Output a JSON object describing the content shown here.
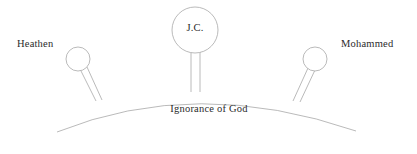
{
  "diagram": {
    "title": "Ignorance of God",
    "stroke_color": "#a8a8a8",
    "text_color": "#2b2b2b",
    "background_color": "#ffffff",
    "arc_label": "Ignorance of God",
    "figures": [
      {
        "id": "heathen",
        "label": "Heathen",
        "head_label": "",
        "position": "left"
      },
      {
        "id": "jesus-christ",
        "label": "J.C.",
        "head_label": "J.C.",
        "position": "center"
      },
      {
        "id": "mohammed",
        "label": "Mohammed",
        "head_label": "",
        "position": "right"
      }
    ]
  }
}
